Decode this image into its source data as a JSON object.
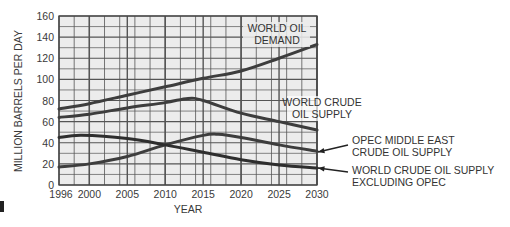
{
  "chart_data": {
    "type": "line",
    "title": "",
    "xlabel": "YEAR",
    "ylabel": "MILLION BARRELS PER DAY",
    "xlim": [
      1996,
      2030
    ],
    "ylim": [
      0,
      160
    ],
    "x_ticks": [
      "1996",
      "2000",
      "2005",
      "2010",
      "2015",
      "2020",
      "2025",
      "2030"
    ],
    "y_ticks": [
      "0",
      "20",
      "40",
      "60",
      "80",
      "100",
      "120",
      "140",
      "160"
    ],
    "grid": true,
    "legend": "inline annotations",
    "series": [
      {
        "name": "WORLD OIL DEMAND",
        "label_lines": [
          "WORLD OIL",
          "DEMAND"
        ],
        "x": [
          1996,
          2000,
          2005,
          2010,
          2015,
          2020,
          2025,
          2030
        ],
        "values": [
          72,
          77,
          85,
          93,
          101,
          108,
          120,
          133
        ]
      },
      {
        "name": "WORLD CRUDE OIL SUPPLY",
        "label_lines": [
          "WORLD CRUDE",
          "OIL SUPPLY"
        ],
        "x": [
          1996,
          2000,
          2005,
          2010,
          2013,
          2015,
          2020,
          2025,
          2030
        ],
        "values": [
          64,
          67,
          73,
          78,
          82,
          80,
          68,
          60,
          52
        ]
      },
      {
        "name": "OPEC MIDDLE EAST CRUDE OIL SUPPLY",
        "label_lines": [
          "OPEC MIDDLE EAST",
          "CRUDE OIL SUPPLY"
        ],
        "x": [
          1996,
          2000,
          2005,
          2010,
          2015,
          2017,
          2020,
          2025,
          2030
        ],
        "values": [
          17,
          20,
          27,
          38,
          47,
          48,
          45,
          38,
          32
        ]
      },
      {
        "name": "WORLD CRUDE OIL SUPPLY EXCLUDING OPEC",
        "label_lines": [
          "WORLD CRUDE OIL SUPPLY",
          "EXCLUDING OPEC"
        ],
        "x": [
          1996,
          1999,
          2005,
          2010,
          2015,
          2020,
          2025,
          2030
        ],
        "values": [
          45,
          47,
          44,
          38,
          31,
          24,
          19,
          16
        ]
      }
    ]
  },
  "colors": {
    "line": "#3d3d3d",
    "grid": "#555555",
    "plot_bg": "#ececec",
    "text": "#333333"
  }
}
